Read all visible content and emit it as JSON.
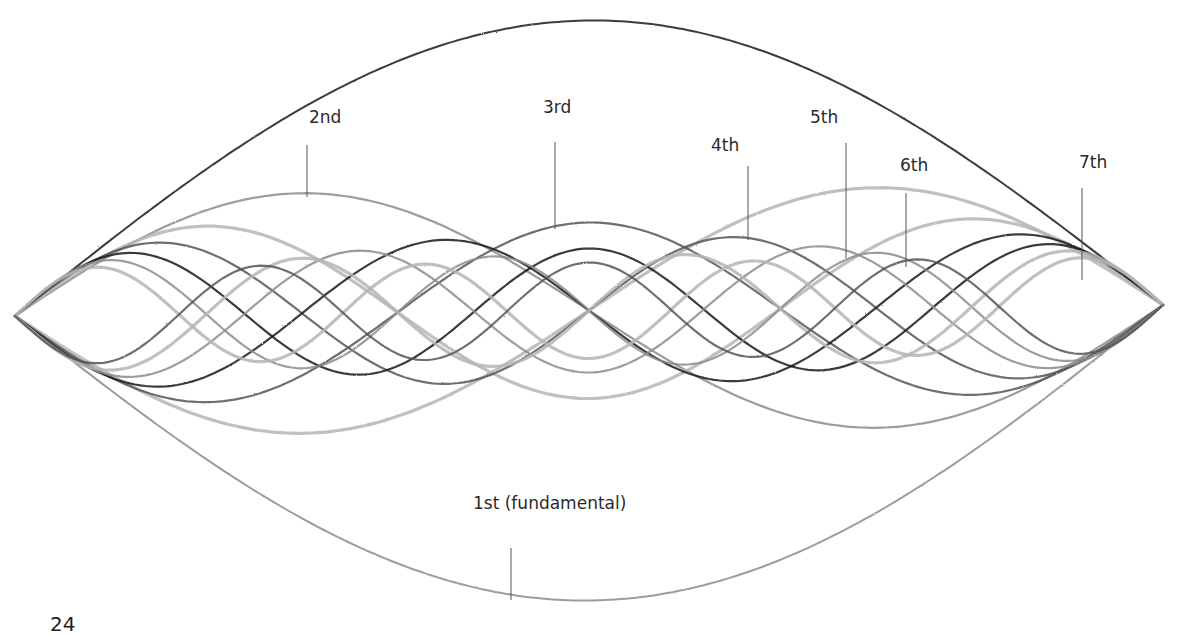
{
  "diagram": {
    "nodes": {
      "left": [
        15,
        316
      ],
      "right": [
        1163,
        305
      ]
    },
    "harmonics": [
      {
        "n": 1,
        "label": "1st (fundamental)",
        "amplitude": 290,
        "label_pos": [
          473,
          493
        ],
        "leader": [
          [
            511,
            548
          ],
          [
            511,
            600
          ]
        ]
      },
      {
        "n": 2,
        "label": "2nd",
        "amplitude": 120,
        "label_pos": [
          309,
          107
        ],
        "leader": [
          [
            307,
            145
          ],
          [
            307,
            197
          ]
        ]
      },
      {
        "n": 3,
        "label": "3rd",
        "amplitude": 88,
        "label_pos": [
          543,
          97
        ],
        "leader": [
          [
            555,
            142
          ],
          [
            555,
            229
          ]
        ]
      },
      {
        "n": 4,
        "label": "4th",
        "amplitude": 72,
        "label_pos": [
          711,
          135
        ],
        "leader": [
          [
            748,
            166
          ],
          [
            748,
            240
          ]
        ]
      },
      {
        "n": 5,
        "label": "5th",
        "amplitude": 62,
        "label_pos": [
          810,
          107
        ],
        "leader": [
          [
            846,
            143
          ],
          [
            846,
            258
          ]
        ]
      },
      {
        "n": 6,
        "label": "6th",
        "amplitude": 55,
        "label_pos": [
          900,
          155
        ],
        "leader": [
          [
            906,
            193
          ],
          [
            906,
            267
          ]
        ]
      },
      {
        "n": 7,
        "label": "7th",
        "amplitude": 48,
        "label_pos": [
          1079,
          152
        ],
        "leader": [
          [
            1082,
            188
          ],
          [
            1082,
            280
          ]
        ]
      }
    ],
    "stroke_colors": [
      "#1a1a1a",
      "#8c8c8c",
      "#b5b5b5",
      "#555555"
    ]
  },
  "page": {
    "number": "24"
  }
}
